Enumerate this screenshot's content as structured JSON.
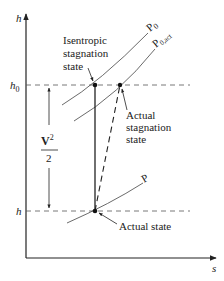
{
  "axes": {
    "y_label": "h",
    "x_label": "s"
  },
  "levels": {
    "h0_label": "h",
    "h0_sub": "0",
    "h_label": "h"
  },
  "kinetic": {
    "numerator": "V",
    "exponent": "2",
    "denominator": "2"
  },
  "isobars": {
    "p0": {
      "label": "P",
      "sub": "0"
    },
    "p0act": {
      "label": "P",
      "sub": "0,act"
    },
    "p": {
      "label": "P"
    }
  },
  "annotations": {
    "isentropic_line1": "Isentropic",
    "isentropic_line2": "stagnation",
    "isentropic_line3": "state",
    "actual_stag_line1": "Actual",
    "actual_stag_line2": "stagnation",
    "actual_stag_line3": "state",
    "actual_state": "Actual state"
  }
}
